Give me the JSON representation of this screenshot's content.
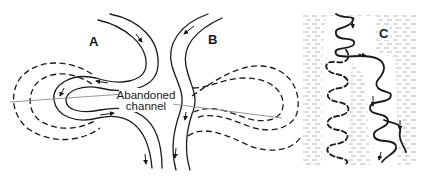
{
  "figure": {
    "panels": [
      {
        "id": "A",
        "label": "A",
        "description": "Meander loop with migrating bend; earlier positions shown dashed"
      },
      {
        "id": "B",
        "label": "B",
        "description": "Straightened channel with abandoned loop shown dashed"
      },
      {
        "id": "C",
        "label": "C",
        "description": "Meander belt in floodplain; abandoned meanders dashed, active channel solid"
      }
    ],
    "callout": {
      "line1": "Abandoned",
      "line2": "channel"
    },
    "colors": {
      "ink": "#1a1a1a",
      "leader": "#8a8a8a",
      "hatch": "#b0b0b0",
      "background": "#ffffff"
    }
  }
}
